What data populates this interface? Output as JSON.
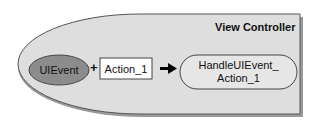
{
  "diagram": {
    "container": {
      "label": "View Controller",
      "fill": "#dedede",
      "stroke": "#555555",
      "shadow": "#9a9a9a"
    },
    "nodes": [
      {
        "id": "uievent",
        "shape": "ellipse",
        "label": "UIEvent",
        "fill": "#8c8c8c"
      },
      {
        "id": "action",
        "shape": "rectangle",
        "label": "Action_1",
        "fill": "#ffffff"
      },
      {
        "id": "handler",
        "shape": "rounded-pill",
        "label_line1": "HandleUIEvent_",
        "label_line2": "Action_1",
        "fill": "#e6e6e6"
      }
    ],
    "operators": {
      "plus": "+",
      "arrow": "➜"
    }
  }
}
